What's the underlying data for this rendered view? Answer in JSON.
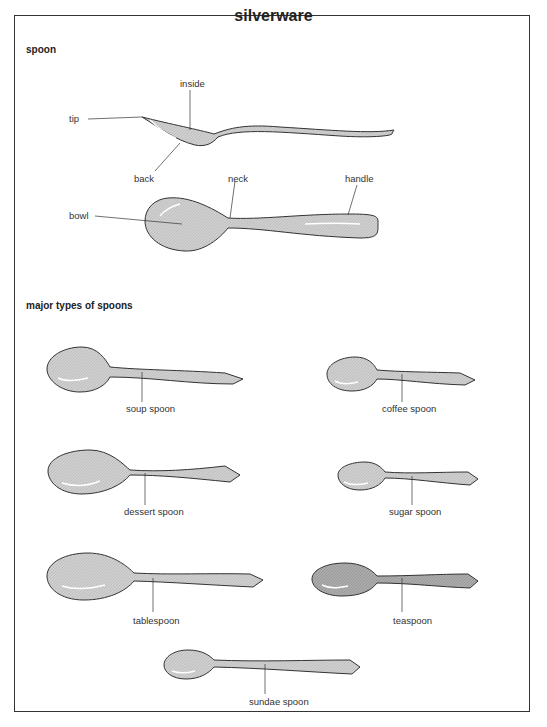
{
  "title": "silverware",
  "sections": {
    "anatomy": "spoon",
    "types": "major types of spoons"
  },
  "anatomy_labels": {
    "inside": "inside",
    "tip": "tip",
    "back": "back",
    "neck": "neck",
    "handle": "handle",
    "bowl": "bowl"
  },
  "spoon_types": [
    {
      "id": "soup",
      "label": "soup spoon"
    },
    {
      "id": "coffee",
      "label": "coffee spoon"
    },
    {
      "id": "dessert",
      "label": "dessert spoon"
    },
    {
      "id": "sugar",
      "label": "sugar spoon"
    },
    {
      "id": "table",
      "label": "tablespoon"
    },
    {
      "id": "tea",
      "label": "teaspoon"
    },
    {
      "id": "sundae",
      "label": "sundae spoon"
    }
  ],
  "colors": {
    "fill": "#c9c9c9",
    "fill_dark": "#a9a9a9",
    "outline": "#333333",
    "highlight": "#ffffff"
  }
}
